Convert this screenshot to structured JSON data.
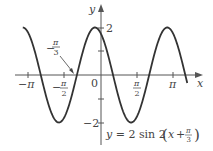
{
  "chart_data": {
    "type": "line",
    "title": "",
    "equation": "y = 2 sin 2(x + π/3)",
    "xlabel": "x",
    "ylabel": "y",
    "xlim": [
      -3.5,
      3.9
    ],
    "ylim": [
      -2.6,
      2.6
    ],
    "x_ticks": [
      {
        "value": -3.14159,
        "label": "−π"
      },
      {
        "value": -1.5708,
        "label": "−π/2"
      },
      {
        "value": 1.5708,
        "label": "π/2"
      },
      {
        "value": 3.14159,
        "label": "π"
      }
    ],
    "y_ticks": [
      {
        "value": 2,
        "label": "2"
      },
      {
        "value": 1,
        "label": ""
      },
      {
        "value": -1,
        "label": ""
      },
      {
        "value": -2,
        "label": "−2"
      }
    ],
    "origin_label": "0",
    "annotations": [
      {
        "text": "−π/3",
        "x": -1.0472,
        "y": 0,
        "arrow": true
      }
    ],
    "series": [
      {
        "name": "y = 2 sin 2(x + π/3)",
        "amplitude": 2,
        "period": 3.14159,
        "phase_shift": -1.0472
      }
    ],
    "grid": false,
    "legend": "none"
  },
  "labels": {
    "y_axis": "y",
    "x_axis": "x",
    "origin": "0",
    "y_top": "2",
    "y_bottom": "−2",
    "neg_pi": "−π",
    "pi": "π",
    "pi_sym": "π",
    "two": "2",
    "three": "3",
    "minus": "−",
    "annot_minus": "−",
    "eq_main": "y = 2 sin 2",
    "eq_x": "x + ",
    "paren_open": "(",
    "paren_close": ")"
  }
}
